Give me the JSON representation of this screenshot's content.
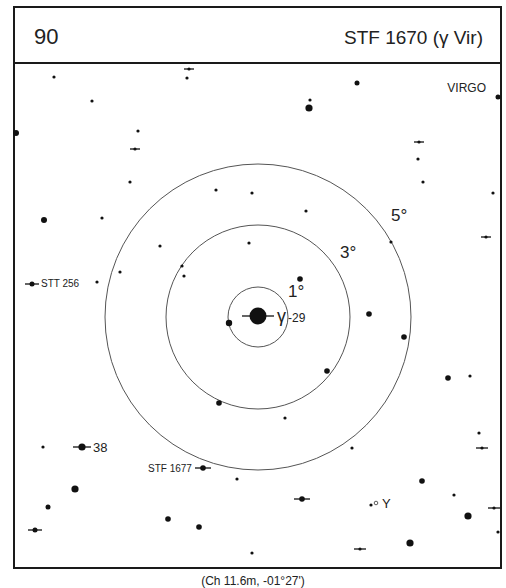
{
  "header": {
    "chart_number": "90",
    "title": "STF 1670 (γ Vir)"
  },
  "constellation_label": "VIRGO",
  "caption": "(Ch 11.6m, -01°27')",
  "colors": {
    "ink": "#111111",
    "ring": "#555555",
    "background": "#ffffff"
  },
  "rings": [
    {
      "label": "1°",
      "radius": 30,
      "label_x": 288,
      "label_y": 297
    },
    {
      "label": "3°",
      "radius": 92,
      "label_x": 340,
      "label_y": 258
    },
    {
      "label": "5°",
      "radius": 153,
      "label_x": 391,
      "label_y": 221
    }
  ],
  "center": {
    "x": 258,
    "y": 317
  },
  "labels": [
    {
      "text": "γ",
      "x": 277,
      "y": 322,
      "size": 18
    },
    {
      "text": "-29",
      "x": 288,
      "y": 322,
      "size": 12
    },
    {
      "text": "STT 256",
      "x": 41,
      "y": 287,
      "size": 10
    },
    {
      "text": "38",
      "x": 93,
      "y": 452,
      "size": 13
    },
    {
      "text": "STF 1677",
      "x": 148,
      "y": 472,
      "size": 10
    },
    {
      "text": "Y",
      "x": 382,
      "y": 508,
      "size": 13
    }
  ],
  "stars": [
    {
      "x": 54,
      "y": 77,
      "r": 1.6
    },
    {
      "x": 92,
      "y": 101,
      "r": 1.6
    },
    {
      "x": 187,
      "y": 78,
      "r": 1.6
    },
    {
      "x": 16,
      "y": 133,
      "r": 3
    },
    {
      "x": 138,
      "y": 131,
      "r": 1.6
    },
    {
      "x": 130,
      "y": 182,
      "r": 1.6
    },
    {
      "x": 44,
      "y": 220,
      "r": 3
    },
    {
      "x": 102,
      "y": 218,
      "r": 1.6
    },
    {
      "x": 160,
      "y": 246,
      "r": 1.6
    },
    {
      "x": 120,
      "y": 272,
      "r": 1.6
    },
    {
      "x": 97,
      "y": 282,
      "r": 1.6
    },
    {
      "x": 182,
      "y": 266,
      "r": 1.6
    },
    {
      "x": 184,
      "y": 276,
      "r": 1.6
    },
    {
      "x": 216,
      "y": 190,
      "r": 1.6
    },
    {
      "x": 252,
      "y": 193,
      "r": 1.6
    },
    {
      "x": 306,
      "y": 211,
      "r": 1.6
    },
    {
      "x": 249,
      "y": 243,
      "r": 1.6
    },
    {
      "x": 310,
      "y": 100,
      "r": 1.6
    },
    {
      "x": 309,
      "y": 108,
      "r": 3.6
    },
    {
      "x": 357,
      "y": 83,
      "r": 2.5
    },
    {
      "x": 418,
      "y": 159,
      "r": 1.6
    },
    {
      "x": 423,
      "y": 182,
      "r": 1.6
    },
    {
      "x": 493,
      "y": 193,
      "r": 1.6
    },
    {
      "x": 498,
      "y": 97,
      "r": 2.5
    },
    {
      "x": 391,
      "y": 242,
      "r": 1.6
    },
    {
      "x": 300,
      "y": 279,
      "r": 2.8
    },
    {
      "x": 229,
      "y": 323,
      "r": 3.2
    },
    {
      "x": 369,
      "y": 314,
      "r": 2.8
    },
    {
      "x": 404,
      "y": 337,
      "r": 2.8
    },
    {
      "x": 327,
      "y": 371,
      "r": 2.8
    },
    {
      "x": 219,
      "y": 403,
      "r": 2.8
    },
    {
      "x": 285,
      "y": 418,
      "r": 1.6
    },
    {
      "x": 448,
      "y": 378,
      "r": 2.8
    },
    {
      "x": 470,
      "y": 376,
      "r": 1.6
    },
    {
      "x": 352,
      "y": 448,
      "r": 1.6
    },
    {
      "x": 479,
      "y": 433,
      "r": 1.6
    },
    {
      "x": 43,
      "y": 447,
      "r": 1.6
    },
    {
      "x": 75,
      "y": 489,
      "r": 3.6
    },
    {
      "x": 48,
      "y": 507,
      "r": 2.5
    },
    {
      "x": 237,
      "y": 479,
      "r": 1.6
    },
    {
      "x": 168,
      "y": 519,
      "r": 2.8
    },
    {
      "x": 199,
      "y": 527,
      "r": 2.8
    },
    {
      "x": 422,
      "y": 481,
      "r": 2.8
    },
    {
      "x": 454,
      "y": 495,
      "r": 1.6
    },
    {
      "x": 468,
      "y": 516,
      "r": 3.6
    },
    {
      "x": 498,
      "y": 532,
      "r": 1.6
    },
    {
      "x": 410,
      "y": 543,
      "r": 3.6
    },
    {
      "x": 252,
      "y": 553,
      "r": 1.6
    },
    {
      "x": 371,
      "y": 505,
      "r": 1.6
    }
  ],
  "doubles": [
    {
      "x": 258,
      "y": 316,
      "r": 8.5,
      "tick": 16
    },
    {
      "x": 189,
      "y": 69,
      "r": 1.6,
      "tick": 5
    },
    {
      "x": 135,
      "y": 149,
      "r": 1.6,
      "tick": 5
    },
    {
      "x": 419,
      "y": 142,
      "r": 1.6,
      "tick": 5
    },
    {
      "x": 486,
      "y": 237,
      "r": 1.6,
      "tick": 5
    },
    {
      "x": 32,
      "y": 284,
      "r": 2.5,
      "tick": 7
    },
    {
      "x": 82,
      "y": 447,
      "r": 3.6,
      "tick": 9
    },
    {
      "x": 203,
      "y": 468,
      "r": 2.8,
      "tick": 8
    },
    {
      "x": 302,
      "y": 499,
      "r": 2.8,
      "tick": 8
    },
    {
      "x": 482,
      "y": 448,
      "r": 1.6,
      "tick": 6
    },
    {
      "x": 494,
      "y": 508,
      "r": 1.6,
      "tick": 6
    },
    {
      "x": 35,
      "y": 530,
      "r": 2.5,
      "tick": 7
    },
    {
      "x": 360,
      "y": 549,
      "r": 1.6,
      "tick": 6
    }
  ],
  "variables": [
    {
      "x": 376,
      "y": 503,
      "r": 1.8
    }
  ]
}
